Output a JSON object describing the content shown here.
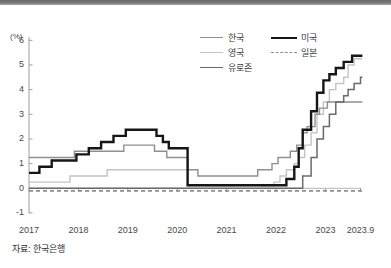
{
  "page": {
    "source_label": "자료: 한국은행"
  },
  "chart_data": {
    "type": "line",
    "title": "",
    "unit_label": "(%)",
    "xlabel": "",
    "ylabel": "(%)",
    "xlim": [
      2017,
      2023.9
    ],
    "ylim": [
      -1,
      6
    ],
    "grid": false,
    "legend_position": "top-right",
    "y_tick_values": [
      6,
      5,
      4,
      3,
      2,
      1,
      0,
      -1
    ],
    "y_tick_labels": [
      "6",
      "5",
      "4",
      "3",
      "2",
      "1",
      "0",
      "-1"
    ],
    "x_tick_values": [
      2017,
      2018,
      2019,
      2020,
      2021,
      2022,
      2023
    ],
    "x_tick_labels": [
      "2017",
      "2018",
      "2019",
      "2020",
      "2021",
      "2022",
      "2023"
    ],
    "end_tick": {
      "value": 2023.71,
      "label": "2023.9"
    },
    "legend_columns": [
      [
        "korea",
        "uk",
        "eurozone"
      ],
      [
        "us",
        "japan"
      ]
    ],
    "draw_order": [
      "uk",
      "korea",
      "japan",
      "eurozone",
      "us"
    ],
    "series": [
      {
        "id": "korea",
        "name": "한국",
        "color": "#8f8f8f",
        "width": 1.4,
        "dash": null,
        "points": [
          [
            2017.0,
            1.25
          ],
          [
            2017.92,
            1.5
          ],
          [
            2018.92,
            1.75
          ],
          [
            2019.54,
            1.5
          ],
          [
            2019.79,
            1.25
          ],
          [
            2020.21,
            0.75
          ],
          [
            2020.42,
            0.5
          ],
          [
            2021.63,
            0.75
          ],
          [
            2021.92,
            1.0
          ],
          [
            2022.04,
            1.25
          ],
          [
            2022.29,
            1.5
          ],
          [
            2022.42,
            1.75
          ],
          [
            2022.54,
            2.25
          ],
          [
            2022.63,
            2.5
          ],
          [
            2022.79,
            3.0
          ],
          [
            2022.88,
            3.25
          ],
          [
            2023.04,
            3.5
          ],
          [
            2023.75,
            3.5
          ]
        ]
      },
      {
        "id": "uk",
        "name": "영국",
        "color": "#c4c4c4",
        "width": 1.4,
        "dash": null,
        "points": [
          [
            2017.0,
            0.25
          ],
          [
            2017.83,
            0.5
          ],
          [
            2018.58,
            0.75
          ],
          [
            2020.21,
            0.1
          ],
          [
            2021.96,
            0.25
          ],
          [
            2022.08,
            0.5
          ],
          [
            2022.21,
            0.75
          ],
          [
            2022.37,
            1.0
          ],
          [
            2022.46,
            1.25
          ],
          [
            2022.58,
            1.75
          ],
          [
            2022.71,
            2.25
          ],
          [
            2022.83,
            3.0
          ],
          [
            2022.96,
            3.5
          ],
          [
            2023.08,
            4.0
          ],
          [
            2023.21,
            4.25
          ],
          [
            2023.37,
            4.5
          ],
          [
            2023.46,
            5.0
          ],
          [
            2023.58,
            5.25
          ],
          [
            2023.75,
            5.25
          ]
        ]
      },
      {
        "id": "eurozone",
        "name": "유로존",
        "color": "#6a6a6a",
        "width": 1.5,
        "dash": null,
        "points": [
          [
            2017.0,
            0.0
          ],
          [
            2022.54,
            0.5
          ],
          [
            2022.71,
            1.25
          ],
          [
            2022.83,
            2.0
          ],
          [
            2022.96,
            2.5
          ],
          [
            2023.08,
            3.0
          ],
          [
            2023.21,
            3.5
          ],
          [
            2023.37,
            3.75
          ],
          [
            2023.46,
            4.0
          ],
          [
            2023.58,
            4.25
          ],
          [
            2023.71,
            4.5
          ],
          [
            2023.75,
            4.5
          ]
        ]
      },
      {
        "id": "us",
        "name": "미국",
        "color": "#161616",
        "width": 2.4,
        "dash": null,
        "points": [
          [
            2017.0,
            0.625
          ],
          [
            2017.21,
            0.875
          ],
          [
            2017.46,
            1.125
          ],
          [
            2017.96,
            1.375
          ],
          [
            2018.21,
            1.625
          ],
          [
            2018.46,
            1.875
          ],
          [
            2018.71,
            2.125
          ],
          [
            2018.96,
            2.375
          ],
          [
            2019.58,
            2.125
          ],
          [
            2019.71,
            1.875
          ],
          [
            2019.83,
            1.625
          ],
          [
            2020.21,
            0.125
          ],
          [
            2022.21,
            0.375
          ],
          [
            2022.37,
            0.875
          ],
          [
            2022.46,
            1.625
          ],
          [
            2022.54,
            2.375
          ],
          [
            2022.71,
            3.125
          ],
          [
            2022.83,
            3.875
          ],
          [
            2022.96,
            4.375
          ],
          [
            2023.08,
            4.625
          ],
          [
            2023.21,
            4.875
          ],
          [
            2023.37,
            5.125
          ],
          [
            2023.54,
            5.375
          ],
          [
            2023.75,
            5.375
          ]
        ]
      },
      {
        "id": "japan",
        "name": "일본",
        "color": "#8f8f8f",
        "width": 1.8,
        "dash": "4 3",
        "points": [
          [
            2017.0,
            -0.1
          ],
          [
            2023.75,
            -0.1
          ]
        ]
      }
    ]
  }
}
